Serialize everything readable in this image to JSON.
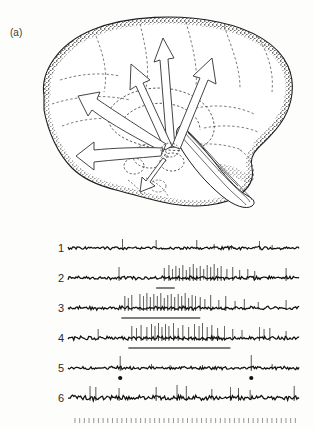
{
  "figure": {
    "panels": [
      {
        "id": "panel-a",
        "label": "(a)",
        "kind": "anatomical-drawing",
        "subject": "sagittal-brain-section",
        "description": "Stippled mid-sagittal drawing of the human brain with broad open arrows radiating from the brainstem reticular formation toward the cerebral cortex",
        "arrow_count": 6
      },
      {
        "id": "panel-b",
        "label": "(b)",
        "kind": "electrophysiology-traces",
        "trace_labels": [
          "1",
          "2",
          "3",
          "4",
          "5",
          "6"
        ],
        "time_marker_row": true
      }
    ]
  },
  "chart_data": {
    "type": "line",
    "title": "",
    "xlabel": "",
    "ylabel": "",
    "grid": false,
    "legend": "none",
    "x_range": [
      0,
      100
    ],
    "traces": [
      {
        "name": "1",
        "label": "1",
        "baseline_y": 26,
        "noise_amplitude": 1.2,
        "spikes": [
          {
            "x": 23.5,
            "height": 9
          },
          {
            "x": 38.0,
            "height": 8
          },
          {
            "x": 55.5,
            "height": 8
          },
          {
            "x": 63.0,
            "height": 4
          },
          {
            "x": 70.5,
            "height": 3
          },
          {
            "x": 82.5,
            "height": 7
          },
          {
            "x": 88.0,
            "height": 3
          }
        ],
        "stimulus_bar": null,
        "dot_markers": []
      },
      {
        "name": "2",
        "label": "2",
        "baseline_y": 56,
        "noise_amplitude": 1.4,
        "spikes": [
          {
            "x": 22.0,
            "height": 11
          },
          {
            "x": 41.5,
            "height": 10
          },
          {
            "x": 43.5,
            "height": 13
          },
          {
            "x": 45.0,
            "height": 9
          },
          {
            "x": 46.5,
            "height": 12
          },
          {
            "x": 48.0,
            "height": 10
          },
          {
            "x": 49.5,
            "height": 13
          },
          {
            "x": 51.0,
            "height": 8
          },
          {
            "x": 52.5,
            "height": 11
          },
          {
            "x": 54.0,
            "height": 14
          },
          {
            "x": 55.5,
            "height": 10
          },
          {
            "x": 57.0,
            "height": 12
          },
          {
            "x": 58.5,
            "height": 9
          },
          {
            "x": 60.0,
            "height": 13
          },
          {
            "x": 61.5,
            "height": 11
          },
          {
            "x": 63.0,
            "height": 14
          },
          {
            "x": 64.5,
            "height": 10
          },
          {
            "x": 66.0,
            "height": 12
          },
          {
            "x": 68.5,
            "height": 9
          },
          {
            "x": 71.0,
            "height": 11
          },
          {
            "x": 74.0,
            "height": 8
          },
          {
            "x": 77.5,
            "height": 9
          },
          {
            "x": 80.5,
            "height": 7
          },
          {
            "x": 94.0,
            "height": 10
          }
        ],
        "stimulus_bar": {
          "start": 38.0,
          "end": 46.0
        },
        "dot_markers": []
      },
      {
        "name": "3",
        "label": "3",
        "baseline_y": 86,
        "noise_amplitude": 1.5,
        "spikes": [
          {
            "x": 24.5,
            "height": 12
          },
          {
            "x": 26.0,
            "height": 10
          },
          {
            "x": 27.5,
            "height": 13
          },
          {
            "x": 31.0,
            "height": 14
          },
          {
            "x": 32.5,
            "height": 12
          },
          {
            "x": 34.0,
            "height": 15
          },
          {
            "x": 35.5,
            "height": 11
          },
          {
            "x": 37.0,
            "height": 14
          },
          {
            "x": 38.5,
            "height": 12
          },
          {
            "x": 40.0,
            "height": 15
          },
          {
            "x": 41.5,
            "height": 10
          },
          {
            "x": 43.0,
            "height": 13
          },
          {
            "x": 44.5,
            "height": 14
          },
          {
            "x": 46.0,
            "height": 11
          },
          {
            "x": 47.5,
            "height": 14
          },
          {
            "x": 49.0,
            "height": 12
          },
          {
            "x": 50.5,
            "height": 15
          },
          {
            "x": 52.0,
            "height": 10
          },
          {
            "x": 53.5,
            "height": 13
          },
          {
            "x": 55.0,
            "height": 12
          },
          {
            "x": 57.0,
            "height": 11
          },
          {
            "x": 59.0,
            "height": 9
          },
          {
            "x": 61.5,
            "height": 13
          },
          {
            "x": 65.0,
            "height": 8
          },
          {
            "x": 68.0,
            "height": 12
          },
          {
            "x": 72.0,
            "height": 7
          },
          {
            "x": 76.0,
            "height": 9
          },
          {
            "x": 82.0,
            "height": 6
          },
          {
            "x": 94.0,
            "height": 8
          }
        ],
        "stimulus_bar": {
          "start": 23.0,
          "end": 57.0
        },
        "dot_markers": []
      },
      {
        "name": "4",
        "label": "4",
        "baseline_y": 116,
        "noise_amplitude": 1.5,
        "spikes": [
          {
            "x": 13.0,
            "height": 9
          },
          {
            "x": 27.5,
            "height": 12
          },
          {
            "x": 29.5,
            "height": 10
          },
          {
            "x": 31.5,
            "height": 13
          },
          {
            "x": 34.0,
            "height": 11
          },
          {
            "x": 36.0,
            "height": 14
          },
          {
            "x": 37.5,
            "height": 12
          },
          {
            "x": 39.0,
            "height": 15
          },
          {
            "x": 40.5,
            "height": 11
          },
          {
            "x": 42.0,
            "height": 14
          },
          {
            "x": 43.5,
            "height": 12
          },
          {
            "x": 45.5,
            "height": 15
          },
          {
            "x": 47.5,
            "height": 10
          },
          {
            "x": 49.5,
            "height": 13
          },
          {
            "x": 52.0,
            "height": 11
          },
          {
            "x": 54.5,
            "height": 14
          },
          {
            "x": 56.5,
            "height": 12
          },
          {
            "x": 58.0,
            "height": 15
          },
          {
            "x": 60.0,
            "height": 11
          },
          {
            "x": 62.0,
            "height": 13
          },
          {
            "x": 64.5,
            "height": 10
          },
          {
            "x": 67.5,
            "height": 12
          },
          {
            "x": 71.0,
            "height": 9
          },
          {
            "x": 75.0,
            "height": 8
          },
          {
            "x": 82.5,
            "height": 11
          },
          {
            "x": 84.5,
            "height": 9
          },
          {
            "x": 87.0,
            "height": 10
          },
          {
            "x": 94.0,
            "height": 7
          }
        ],
        "stimulus_bar": {
          "start": 26.0,
          "end": 70.0
        },
        "dot_markers": []
      },
      {
        "name": "5",
        "label": "5",
        "baseline_y": 146,
        "noise_amplitude": 1.3,
        "spikes": [
          {
            "x": 22.5,
            "height": 12
          },
          {
            "x": 36.0,
            "height": 4
          },
          {
            "x": 44.0,
            "height": 3
          },
          {
            "x": 58.0,
            "height": 3
          },
          {
            "x": 79.0,
            "height": 13
          },
          {
            "x": 88.0,
            "height": 4
          }
        ],
        "stimulus_bar": null,
        "dot_markers": [
          22.5,
          79.0
        ]
      },
      {
        "name": "6",
        "label": "6",
        "baseline_y": 176,
        "noise_amplitude": 2.0,
        "spikes": [
          {
            "x": 9.5,
            "height": 12
          },
          {
            "x": 12.0,
            "height": 11
          },
          {
            "x": 22.0,
            "height": 10
          },
          {
            "x": 38.0,
            "height": 11
          },
          {
            "x": 47.0,
            "height": 13
          },
          {
            "x": 51.0,
            "height": 12
          },
          {
            "x": 62.0,
            "height": 9
          },
          {
            "x": 70.0,
            "height": 11
          },
          {
            "x": 73.5,
            "height": 10
          },
          {
            "x": 78.5,
            "height": 8
          },
          {
            "x": 97.5,
            "height": 12
          }
        ],
        "stimulus_bar": null,
        "dot_markers": []
      }
    ],
    "time_markers": {
      "start": 3.0,
      "end": 98.0,
      "count": 48,
      "tick_height": 5
    }
  },
  "style": {
    "ink": "#1a1a1a",
    "trace_ink": "#111111",
    "bar_ink": "#555555",
    "background": "#fdfdfb"
  }
}
